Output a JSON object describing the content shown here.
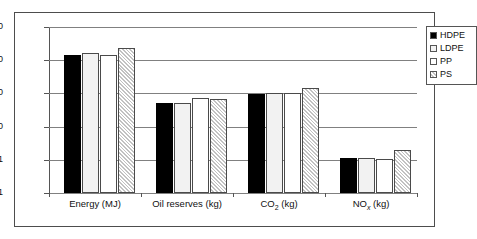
{
  "chart_data": {
    "type": "bar",
    "title": "",
    "xlabel": "",
    "ylabel": "",
    "yscale": "log",
    "ylim": [
      0.1,
      10000
    ],
    "grid": true,
    "legend_position": "top-right",
    "ytick_labels": [
      "10 000",
      "1000",
      "100",
      "10",
      "1",
      "0.1"
    ],
    "ytick_values": [
      10000,
      1000,
      100,
      10,
      1,
      0.1
    ],
    "categories": [
      "Energy (MJ)",
      "Oil reserves (kg)",
      "CO2 (kg)",
      "NOx (kg)"
    ],
    "series": [
      {
        "name": "HDPE",
        "values": [
          1400,
          52,
          95,
          1.1
        ]
      },
      {
        "name": "LDPE",
        "values": [
          1600,
          52,
          105,
          1.1
        ]
      },
      {
        "name": "PP",
        "values": [
          1400,
          71,
          100,
          1.05
        ]
      },
      {
        "name": "PS",
        "values": [
          2400,
          67,
          150,
          2.0
        ]
      }
    ]
  },
  "axis": {
    "ticks": [
      {
        "label": "10 000"
      },
      {
        "label": "1000"
      },
      {
        "label": "100"
      },
      {
        "label": "10"
      },
      {
        "label": "1"
      },
      {
        "label": "0.1"
      }
    ]
  },
  "categories": [
    {
      "main": "Energy (MJ)",
      "sub": "",
      "tail": ""
    },
    {
      "main": "Oil reserves (kg)",
      "sub": "",
      "tail": ""
    },
    {
      "main": "CO",
      "sub": "2",
      "tail": " (kg)"
    },
    {
      "main": "NO",
      "sub": "x",
      "tail": " (kg)"
    }
  ],
  "legend": {
    "items": [
      {
        "label": "HDPE",
        "swatch": "solid-black-swatch",
        "color": "#000000"
      },
      {
        "label": "LDPE",
        "swatch": "dotted-light-swatch",
        "color": "#f2f2f2"
      },
      {
        "label": "PP",
        "swatch": "white-swatch",
        "color": "#ffffff"
      },
      {
        "label": "PS",
        "swatch": "hatched-gray-swatch",
        "color": "#e8e8e8"
      }
    ]
  },
  "colors": {
    "frame": "#4d4d4d",
    "grid": "#808080",
    "axis": "#555555",
    "text": "#111111"
  }
}
